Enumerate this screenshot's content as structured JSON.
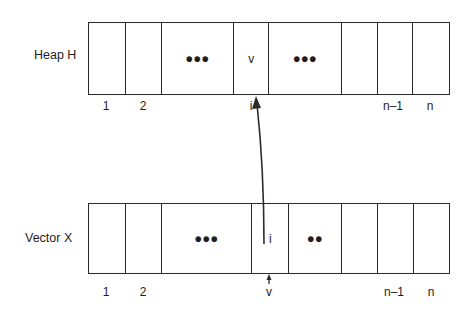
{
  "diagram": {
    "type": "heap-vector-index-mapping",
    "colors": {
      "stroke": "#2a2a2a",
      "background": "#ffffff",
      "text": "#1e1e1e"
    },
    "heap": {
      "label": "Heap H",
      "cells": [
        {
          "content": "",
          "x": 88,
          "w": 37
        },
        {
          "content": "",
          "x": 125,
          "w": 36
        },
        {
          "content": "•••",
          "x": 161,
          "w": 72
        },
        {
          "content": "v",
          "x": 233,
          "w": 35
        },
        {
          "content": "•••",
          "x": 268,
          "w": 73
        },
        {
          "content": "",
          "x": 341,
          "w": 36
        },
        {
          "content": "",
          "x": 377,
          "w": 35
        },
        {
          "content": "",
          "x": 412,
          "w": 36
        }
      ],
      "indices": [
        {
          "label": "1",
          "x": 106
        },
        {
          "label": "2",
          "x": 143
        },
        {
          "label": "i",
          "x": 251
        },
        {
          "label": "n–1",
          "x": 393
        },
        {
          "label": "n",
          "x": 430
        }
      ]
    },
    "vector": {
      "label": "Vector X",
      "cells": [
        {
          "content": "",
          "x": 88,
          "w": 37
        },
        {
          "content": "",
          "x": 125,
          "w": 36
        },
        {
          "content": "•••",
          "x": 161,
          "w": 90
        },
        {
          "content": "i",
          "x": 251,
          "w": 37
        },
        {
          "content": "••",
          "x": 288,
          "w": 53
        },
        {
          "content": "",
          "x": 341,
          "w": 36
        },
        {
          "content": "",
          "x": 377,
          "w": 36
        },
        {
          "content": "",
          "x": 413,
          "w": 35
        }
      ],
      "indices": [
        {
          "label": "1",
          "x": 106
        },
        {
          "label": "2",
          "x": 143
        },
        {
          "label": "v",
          "x": 269
        },
        {
          "label": "n–1",
          "x": 394
        },
        {
          "label": "n",
          "x": 431
        }
      ]
    },
    "arrows": [
      {
        "name": "vector-to-heap-pointer",
        "from": "vector cell i",
        "to": "heap index i"
      },
      {
        "name": "value-pointer",
        "from": "label v",
        "to": "vector cell i"
      }
    ]
  }
}
